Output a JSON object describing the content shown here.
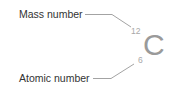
{
  "diagram": {
    "element_symbol": "C",
    "mass_number": "12",
    "atomic_number": "6",
    "labels": {
      "mass": "Mass number",
      "atomic": "Atomic number"
    },
    "colors": {
      "label_text": "#333333",
      "symbol": "#9a9a9a",
      "numbers": "#a8a8a8",
      "leader_lines": "#8c8c8c"
    }
  }
}
